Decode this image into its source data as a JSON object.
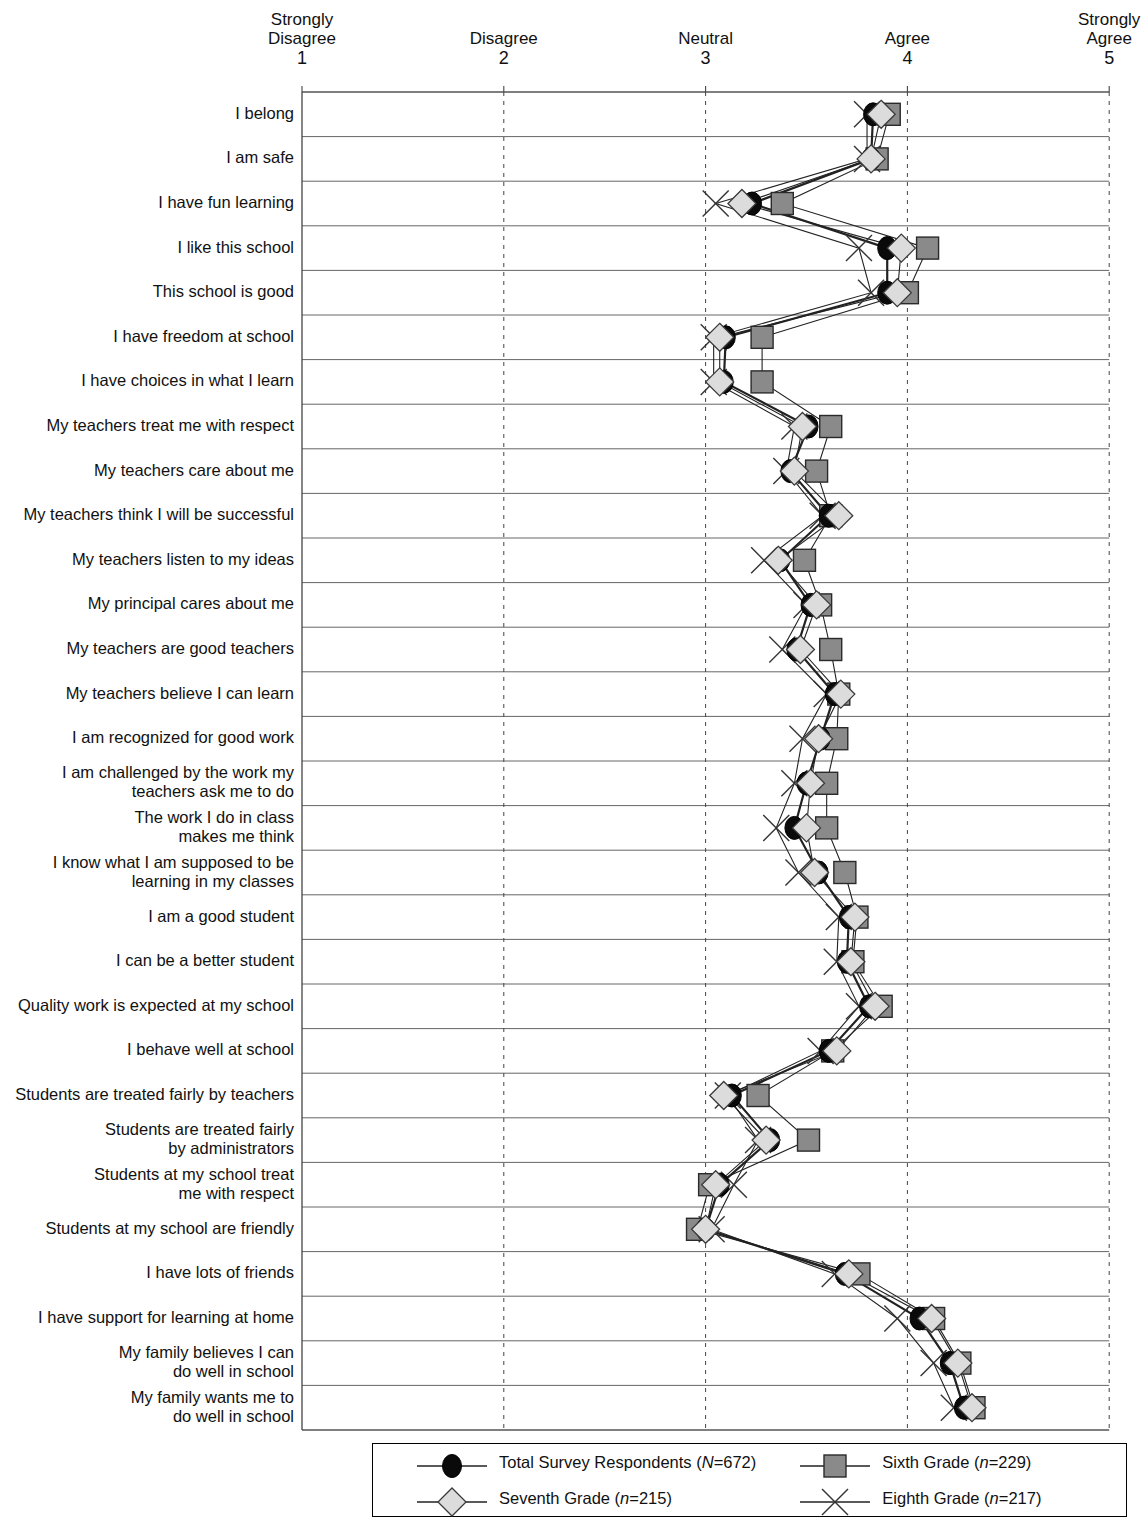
{
  "axis": {
    "ticks": [
      {
        "label_line1": "Strongly",
        "label_line2": "Disagree",
        "value": "1"
      },
      {
        "label_line1": "Disagree",
        "label_line2": "",
        "value": "2"
      },
      {
        "label_line1": "Neutral",
        "label_line2": "",
        "value": "3"
      },
      {
        "label_line1": "Agree",
        "label_line2": "",
        "value": "4"
      },
      {
        "label_line1": "Strongly",
        "label_line2": "Agree",
        "value": "5"
      }
    ]
  },
  "legend": {
    "entries": [
      {
        "name": "total",
        "label": "Total Survey Respondents (",
        "stat": "N",
        "eq": "=672)",
        "marker": "circle",
        "color": "#000000"
      },
      {
        "name": "sixth",
        "label": "Sixth Grade (",
        "stat": "n",
        "eq": "=229)",
        "marker": "square",
        "color": "#7d7d7d"
      },
      {
        "name": "seventh",
        "label": "Seventh Grade (",
        "stat": "n",
        "eq": "=215)",
        "marker": "diamond",
        "color": "#d9d9d9"
      },
      {
        "name": "eighth",
        "label": "Eighth Grade (",
        "stat": "n",
        "eq": "=217)",
        "marker": "cross",
        "color": "#555555"
      }
    ]
  },
  "chart_data": {
    "type": "line",
    "title": "",
    "xlabel": "",
    "ylabel": "",
    "xlim": [
      1,
      5
    ],
    "grid": true,
    "orientation": "horizontal",
    "legend_position": "bottom",
    "tick_labels": [
      "Strongly Disagree 1",
      "Disagree 2",
      "Neutral 3",
      "Agree 4",
      "Strongly Agree 5"
    ],
    "categories": [
      "I belong",
      "I am safe",
      "I have fun learning",
      "I like this school",
      "This school is good",
      "I have freedom at school",
      "I have choices in what I learn",
      "My teachers treat me with respect",
      "My teachers care about me",
      "My teachers think I will be successful",
      "My teachers listen to my ideas",
      "My principal cares about me",
      "My teachers are good teachers",
      "My teachers believe I can learn",
      "I am recognized for good work",
      "I am challenged by the work my\nteachers ask me to do",
      "The work I do in class\nmakes me think",
      "I know what I am supposed to be\nlearning in my classes",
      "I am a good student",
      "I can be a better student",
      "Quality work is expected at my school",
      "I behave well at school",
      "Students are treated fairly by teachers",
      "Students are treated fairly\nby administrators",
      "Students at my school treat\nme with respect",
      "Students at my school are friendly",
      "I have lots of friends",
      "I have support for learning at home",
      "My family believes I can\ndo well in school",
      "My family wants me to\ndo well in school"
    ],
    "series": [
      {
        "name": "Total Survey Respondents (N=672)",
        "key": "total",
        "marker": "circle",
        "values": [
          3.83,
          3.82,
          3.23,
          3.9,
          3.9,
          3.1,
          3.09,
          3.51,
          3.42,
          3.61,
          3.37,
          3.52,
          3.45,
          3.64,
          3.57,
          3.5,
          3.44,
          3.56,
          3.71,
          3.7,
          3.81,
          3.61,
          3.13,
          3.32,
          3.07,
          3.0,
          3.69,
          4.06,
          4.21,
          4.28
        ]
      },
      {
        "name": "Sixth Grade (n=229)",
        "key": "sixth",
        "marker": "square",
        "values": [
          3.91,
          3.85,
          3.38,
          4.1,
          4.0,
          3.28,
          3.28,
          3.62,
          3.55,
          3.62,
          3.49,
          3.57,
          3.62,
          3.66,
          3.65,
          3.6,
          3.6,
          3.69,
          3.75,
          3.73,
          3.87,
          3.63,
          3.26,
          3.51,
          3.02,
          2.96,
          3.76,
          4.13,
          4.26,
          4.33
        ]
      },
      {
        "name": "Seventh Grade (n=215)",
        "key": "seventh",
        "marker": "diamond",
        "values": [
          3.87,
          3.82,
          3.18,
          3.97,
          3.95,
          3.07,
          3.07,
          3.48,
          3.44,
          3.66,
          3.36,
          3.55,
          3.47,
          3.67,
          3.56,
          3.52,
          3.5,
          3.54,
          3.74,
          3.72,
          3.84,
          3.65,
          3.09,
          3.3,
          3.05,
          3.0,
          3.71,
          4.12,
          4.25,
          4.32
        ]
      },
      {
        "name": "Eighth Grade (n=217)",
        "key": "eighth",
        "marker": "cross",
        "values": [
          3.8,
          3.8,
          3.05,
          3.76,
          3.82,
          3.04,
          3.04,
          3.44,
          3.4,
          3.58,
          3.29,
          3.5,
          3.38,
          3.6,
          3.48,
          3.44,
          3.35,
          3.46,
          3.66,
          3.65,
          3.76,
          3.57,
          3.11,
          3.26,
          3.14,
          3.03,
          3.64,
          3.95,
          4.13,
          4.23
        ]
      }
    ]
  }
}
